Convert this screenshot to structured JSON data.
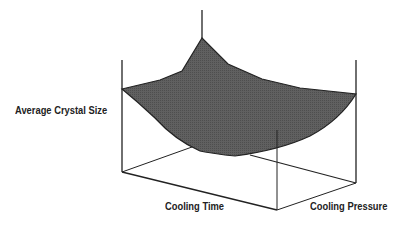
{
  "diagram": {
    "type": "3d-surface",
    "axes": {
      "z_label": "Average Crystal Size",
      "x_label": "Cooling Time",
      "y_label": "Cooling Pressure"
    },
    "colors": {
      "surface": "#5a5a5a",
      "lines": "#222222",
      "background": "#ffffff"
    }
  }
}
